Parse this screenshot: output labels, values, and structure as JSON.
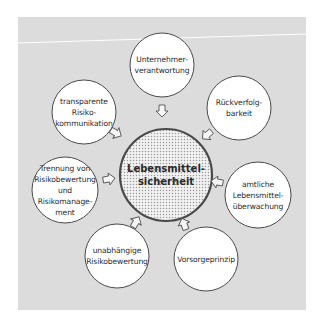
{
  "diagram": {
    "type": "hub-and-spoke",
    "background_color": "#dcdcdc",
    "center": {
      "lines": [
        "Lebensmittel-",
        "sicherheit"
      ],
      "fill_pattern": "dotted",
      "x": 166,
      "y": 175,
      "r": 46
    },
    "nodes": [
      {
        "id": "unternehmerverantwortung",
        "lines": [
          "Unternehmer-",
          "verantwortung"
        ],
        "x": 162,
        "y": 65,
        "r": 32
      },
      {
        "id": "rueckverfolgbarkeit",
        "lines": [
          "Rückverfolg-",
          "barkeit"
        ],
        "x": 239,
        "y": 108,
        "r": 32
      },
      {
        "id": "amtliche-lebensmittelueberwachung",
        "lines": [
          "amtliche",
          "Lebensmittel-",
          "überwachung"
        ],
        "x": 258,
        "y": 195,
        "r": 33
      },
      {
        "id": "vorsorgeprinzip",
        "lines": [
          "Vorsorgeprinzip"
        ],
        "x": 206,
        "y": 259,
        "r": 32
      },
      {
        "id": "unabhaengige-risikobewertung",
        "lines": [
          "unabhängige",
          "Risikobewertung"
        ],
        "x": 117,
        "y": 256,
        "r": 32
      },
      {
        "id": "trennung-risikobewertung-risikomanagement",
        "lines": [
          "Trennung von",
          "Risikobewertung",
          "und",
          "Risikomanage-",
          "ment"
        ],
        "x": 65,
        "y": 190,
        "r": 33
      },
      {
        "id": "transparente-risikokommunikation",
        "lines": [
          "transparente",
          "Risiko-",
          "kommunikation"
        ],
        "x": 84,
        "y": 112,
        "r": 32
      }
    ],
    "arrows": [
      {
        "from": "unternehmerverantwortung",
        "x": 162,
        "y": 111,
        "angle": 90
      },
      {
        "from": "rueckverfolgbarkeit",
        "x": 207,
        "y": 135,
        "angle": 140
      },
      {
        "from": "amtliche-lebensmittelueberwachung",
        "x": 217,
        "y": 182,
        "angle": 190
      },
      {
        "from": "vorsorgeprinzip",
        "x": 184,
        "y": 224,
        "angle": 250
      },
      {
        "from": "unabhaengige-risikobewertung",
        "x": 136,
        "y": 222,
        "angle": 300
      },
      {
        "from": "trennung-risikobewertung-risikomanagement",
        "x": 109,
        "y": 179,
        "angle": 350
      },
      {
        "from": "transparente-risikokommunikation",
        "x": 116,
        "y": 133,
        "angle": 30
      }
    ]
  }
}
